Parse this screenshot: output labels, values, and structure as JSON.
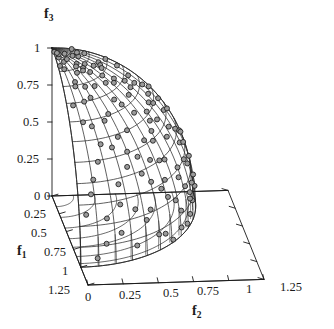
{
  "chart_data": {
    "type": "scatter",
    "title": "",
    "subtitle": "",
    "projection": "3d",
    "axes": {
      "x": {
        "name": "f",
        "sub": "2",
        "label": "f2",
        "ticks": [
          0,
          0.25,
          0.5,
          0.75,
          1,
          1.25
        ],
        "tick_labels": [
          "0",
          "0.25",
          "0.5",
          "0.75",
          "1",
          "1.25"
        ],
        "range": [
          0,
          1.25
        ],
        "grid": false
      },
      "y": {
        "name": "f",
        "sub": "1",
        "label": "f1",
        "ticks": [
          0,
          0.25,
          0.5,
          0.75,
          1,
          1.25
        ],
        "tick_labels": [
          "0",
          "0.25",
          "0.5",
          "0.75",
          "1",
          "1.25"
        ],
        "range": [
          0,
          1.25
        ],
        "grid": false
      },
      "z": {
        "name": "f",
        "sub": "3",
        "label": "f3",
        "ticks": [
          0,
          0.25,
          0.5,
          0.75,
          1
        ],
        "tick_labels": [
          "0",
          "0.25",
          "0.5",
          "0.75",
          "1"
        ],
        "range": [
          0,
          1
        ],
        "grid": false
      }
    },
    "surface": {
      "name": "true Pareto front",
      "equation": "f1^2 + f2^2 + f3^2 = 1",
      "mesh_u_lines": 12,
      "mesh_v_lines": 12,
      "stroke": "#262626"
    },
    "series": [
      {
        "name": "obtained solutions",
        "marker": "circle",
        "marker_fill": "#9a9a9a",
        "marker_stroke": "#1a1a1a",
        "marker_size": 5,
        "count": 120,
        "points_spherical_deg": [
          [
            3,
            6
          ],
          [
            7,
            11
          ],
          [
            5,
            21
          ],
          [
            10,
            17
          ],
          [
            14,
            9
          ],
          [
            9,
            30
          ],
          [
            17,
            25
          ],
          [
            13,
            38
          ],
          [
            21,
            15
          ],
          [
            19,
            43
          ],
          [
            25,
            33
          ],
          [
            23,
            52
          ],
          [
            29,
            22
          ],
          [
            27,
            60
          ],
          [
            33,
            41
          ],
          [
            31,
            68
          ],
          [
            37,
            29
          ],
          [
            35,
            75
          ],
          [
            41,
            49
          ],
          [
            39,
            82
          ],
          [
            45,
            36
          ],
          [
            43,
            88
          ],
          [
            47,
            57
          ],
          [
            51,
            44
          ],
          [
            49,
            64
          ],
          [
            53,
            12
          ],
          [
            55,
            71
          ],
          [
            57,
            27
          ],
          [
            59,
            78
          ],
          [
            61,
            52
          ],
          [
            63,
            85
          ],
          [
            65,
            38
          ],
          [
            67,
            60
          ],
          [
            69,
            19
          ],
          [
            71,
            73
          ],
          [
            73,
            46
          ],
          [
            75,
            88
          ],
          [
            77,
            31
          ],
          [
            79,
            66
          ],
          [
            81,
            54
          ],
          [
            83,
            80
          ],
          [
            85,
            41
          ],
          [
            87,
            7
          ],
          [
            11,
            62
          ],
          [
            15,
            50
          ],
          [
            19,
            71
          ],
          [
            23,
            13
          ],
          [
            27,
            84
          ],
          [
            31,
            5
          ],
          [
            35,
            57
          ],
          [
            39,
            24
          ],
          [
            43,
            69
          ],
          [
            47,
            16
          ],
          [
            51,
            79
          ],
          [
            55,
            35
          ],
          [
            59,
            8
          ],
          [
            63,
            74
          ],
          [
            67,
            47
          ],
          [
            71,
            3
          ],
          [
            75,
            62
          ],
          [
            79,
            18
          ],
          [
            83,
            68
          ],
          [
            87,
            53
          ],
          [
            6,
            45
          ],
          [
            10,
            76
          ],
          [
            14,
            32
          ],
          [
            18,
            58
          ],
          [
            22,
            86
          ],
          [
            26,
            47
          ],
          [
            30,
            15
          ],
          [
            34,
            66
          ],
          [
            38,
            9
          ],
          [
            42,
            77
          ],
          [
            46,
            28
          ],
          [
            50,
            53
          ],
          [
            54,
            87
          ],
          [
            58,
            42
          ],
          [
            62,
            20
          ],
          [
            66,
            81
          ],
          [
            70,
            58
          ],
          [
            74,
            34
          ],
          [
            78,
            72
          ],
          [
            82,
            11
          ],
          [
            86,
            63
          ],
          [
            8,
            89
          ],
          [
            12,
            4
          ],
          [
            16,
            40
          ],
          [
            20,
            67
          ],
          [
            24,
            23
          ],
          [
            28,
            55
          ],
          [
            32,
            79
          ],
          [
            36,
            44
          ],
          [
            40,
            14
          ],
          [
            44,
            60
          ],
          [
            48,
            85
          ],
          [
            52,
            30
          ],
          [
            56,
            63
          ],
          [
            60,
            48
          ],
          [
            64,
            6
          ],
          [
            68,
            70
          ],
          [
            72,
            26
          ],
          [
            76,
            51
          ],
          [
            80,
            83
          ],
          [
            84,
            37
          ],
          [
            88,
            59
          ],
          [
            4,
            18
          ],
          [
            9,
            54
          ],
          [
            13,
            81
          ],
          [
            17,
            36
          ],
          [
            21,
            63
          ],
          [
            45,
            73
          ],
          [
            49,
            22
          ],
          [
            53,
            50
          ],
          [
            61,
            34
          ],
          [
            65,
            88
          ],
          [
            69,
            43
          ],
          [
            73,
            12
          ],
          [
            81,
            65
          ],
          [
            85,
            25
          ],
          [
            89,
            46
          ]
        ],
        "note": "points_spherical_deg entries are [polar_deg_from_f3_axis, azimuth_deg_from_f1_axis] on the unit sphere octant"
      }
    ],
    "base_plane": {
      "projected_arcs": 7,
      "drop_lines": true,
      "arc_radii": [
        0.15,
        0.3,
        0.45,
        0.6,
        0.72,
        0.85,
        0.95
      ]
    },
    "legend": {
      "visible": false,
      "position": "none"
    },
    "annotations": []
  },
  "axis_labels": {
    "f3": {
      "text": "f",
      "sub": "3"
    },
    "f2": {
      "text": "f",
      "sub": "2"
    },
    "f1": {
      "text": "f",
      "sub": "1"
    }
  },
  "z_ticks": [
    "1",
    "0.75",
    "0.5",
    "0.25",
    "0"
  ],
  "y_ticks": [
    "0",
    "0.25",
    "0.5",
    "0.75",
    "1",
    "1.25"
  ],
  "x_ticks": [
    "0",
    "0.25",
    "0.5",
    "0.75",
    "1",
    "1.25"
  ],
  "colors": {
    "background": "#ffffff",
    "axis": "#1a1a1a",
    "mesh": "#2b2b2b",
    "marker_fill": "#9b9b9b",
    "marker_stroke": "#161616",
    "text": "#151515"
  }
}
